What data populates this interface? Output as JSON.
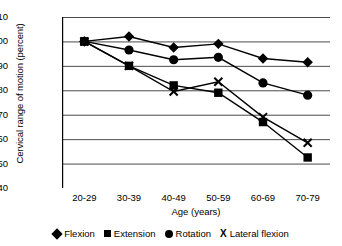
{
  "chart_data": {
    "type": "line",
    "title": "",
    "xlabel": "Age (years)",
    "ylabel": "Cervical range of motion (percent)",
    "categories": [
      "20-29",
      "30-39",
      "40-49",
      "50-59",
      "60-69",
      "70-79"
    ],
    "ylim": [
      40,
      110
    ],
    "yticks": [
      40,
      50,
      60,
      70,
      80,
      90,
      100,
      110
    ],
    "grid": true,
    "legend_position": "bottom",
    "series": [
      {
        "name": "Flexion",
        "marker": "diamond-marker",
        "values": [
          100,
          102,
          97.5,
          99,
          93,
          91.5
        ]
      },
      {
        "name": "Extension",
        "marker": "square-marker",
        "values": [
          100,
          90,
          82,
          79,
          67,
          52.5
        ]
      },
      {
        "name": "Rotation",
        "marker": "circle-marker",
        "values": [
          100,
          96.5,
          92.5,
          93.5,
          83,
          78
        ]
      },
      {
        "name": "Lateral flexion",
        "marker": "x-marker",
        "values": [
          100,
          90,
          79.5,
          83.5,
          69,
          58.5
        ]
      }
    ]
  }
}
